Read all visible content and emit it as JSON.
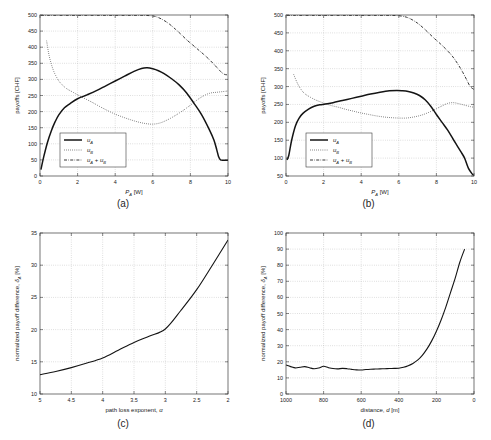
{
  "figure": {
    "background": "#ffffff",
    "ink": "#141414",
    "grid_color": "#9a9a9a",
    "panel_count": 4
  },
  "panels": [
    {
      "id": "a",
      "caption": "(a)",
      "legend_position": "lower-left-inside"
    },
    {
      "id": "b",
      "caption": "(b)",
      "legend_position": "lower-left-inside"
    },
    {
      "id": "c",
      "caption": "(c)",
      "legend_position": "none"
    },
    {
      "id": "d",
      "caption": "(d)",
      "legend_position": "none"
    }
  ],
  "chart_data": [
    {
      "type": "line",
      "panel": "a",
      "title": "",
      "xlabel": "P_A [W]",
      "xlabel_parts": {
        "main": "P",
        "sub": "A",
        "unit": " [W]"
      },
      "ylabel": "payoffs [CHF]",
      "xlim": [
        0,
        10
      ],
      "ylim": [
        0,
        500
      ],
      "xticks": [
        0,
        2,
        4,
        6,
        8,
        10
      ],
      "xticklabels": [
        "0",
        "2",
        "4",
        "6",
        "8",
        "10"
      ],
      "yticks": [
        0,
        50,
        100,
        150,
        200,
        250,
        300,
        350,
        400,
        450,
        500
      ],
      "yticklabels": [
        "0",
        "50",
        "100",
        "150",
        "200",
        "250",
        "300",
        "350",
        "400",
        "450",
        "500"
      ],
      "x_reversed": false,
      "grid": true,
      "legend": [
        "u_A",
        "u_B",
        "u_A + u_B"
      ],
      "legend_labels": [
        {
          "main": "u",
          "sub": "A",
          "tail": ""
        },
        {
          "main": "u",
          "sub": "B",
          "tail": ""
        },
        {
          "main": "u",
          "sub": "A",
          "tail": " + u_B"
        }
      ],
      "series": [
        {
          "name": "u_A",
          "style": "solid",
          "x": [
            0.05,
            0.2,
            0.4,
            0.6,
            0.8,
            1.0,
            1.3,
            1.6,
            2.0,
            2.5,
            3.0,
            3.5,
            4.0,
            4.5,
            5.0,
            5.4,
            5.7,
            6.0,
            6.3,
            6.6,
            7.0,
            7.4,
            7.8,
            8.2,
            8.6,
            9.0,
            9.25,
            9.4,
            9.5,
            9.6,
            9.8,
            10.0
          ],
          "y": [
            20,
            60,
            105,
            140,
            168,
            190,
            212,
            225,
            240,
            252,
            265,
            280,
            295,
            310,
            325,
            334,
            336,
            333,
            327,
            318,
            302,
            283,
            258,
            225,
            190,
            145,
            112,
            82,
            60,
            50,
            49,
            49
          ]
        },
        {
          "name": "u_B",
          "style": "dotted",
          "x": [
            0.35,
            0.5,
            0.7,
            0.9,
            1.1,
            1.4,
            1.7,
            2.0,
            2.4,
            2.8,
            3.2,
            3.6,
            4.0,
            4.4,
            4.8,
            5.2,
            5.6,
            6.0,
            6.4,
            6.8,
            7.2,
            7.6,
            8.0,
            8.4,
            8.8,
            9.1,
            9.4,
            9.7,
            10.0
          ],
          "y": [
            420,
            370,
            330,
            305,
            288,
            272,
            262,
            252,
            240,
            228,
            215,
            203,
            192,
            183,
            175,
            168,
            163,
            161,
            165,
            175,
            188,
            203,
            220,
            238,
            252,
            258,
            260,
            262,
            264
          ]
        },
        {
          "name": "u_A + u_B",
          "style": "dashdot",
          "x": [
            0.05,
            0.5,
            1.0,
            1.5,
            2.0,
            2.5,
            3.0,
            3.5,
            4.0,
            4.5,
            5.0,
            5.5,
            6.0,
            6.3,
            6.6,
            6.9,
            7.2,
            7.5,
            7.8,
            8.1,
            8.4,
            8.7,
            9.0,
            9.3,
            9.6,
            9.8,
            10.0
          ],
          "y": [
            499,
            499,
            499,
            499,
            499,
            499,
            499,
            499,
            499,
            499,
            499,
            499,
            497,
            492,
            483,
            471,
            456,
            440,
            423,
            408,
            393,
            378,
            362,
            344,
            325,
            316,
            314
          ]
        }
      ]
    },
    {
      "type": "line",
      "panel": "b",
      "title": "",
      "xlabel": "P_A [W]",
      "xlabel_parts": {
        "main": "P",
        "sub": "A",
        "unit": " [W]"
      },
      "ylabel": "payoffs [CHF]",
      "xlim": [
        0,
        10
      ],
      "ylim": [
        50,
        500
      ],
      "xticks": [
        0,
        2,
        4,
        6,
        8,
        10
      ],
      "xticklabels": [
        "0",
        "2",
        "4",
        "6",
        "8",
        "10"
      ],
      "yticks": [
        50,
        100,
        150,
        200,
        250,
        300,
        350,
        400,
        450,
        500
      ],
      "yticklabels": [
        "50",
        "100",
        "150",
        "200",
        "250",
        "300",
        "350",
        "400",
        "450",
        "500"
      ],
      "x_reversed": false,
      "grid": true,
      "legend": [
        "u_A",
        "u_B",
        "u_A + u_B"
      ],
      "legend_labels": [
        {
          "main": "u",
          "sub": "A",
          "tail": ""
        },
        {
          "main": "u",
          "sub": "B",
          "tail": ""
        },
        {
          "main": "u",
          "sub": "A",
          "tail": " + u_B"
        }
      ],
      "series": [
        {
          "name": "u_A",
          "style": "solid",
          "x": [
            0.05,
            0.15,
            0.3,
            0.5,
            0.7,
            0.9,
            1.2,
            1.5,
            1.8,
            2.1,
            2.5,
            3.0,
            3.5,
            4.0,
            4.5,
            5.0,
            5.5,
            5.9,
            6.2,
            6.5,
            6.8,
            7.1,
            7.4,
            7.7,
            8.0,
            8.3,
            8.6,
            8.9,
            9.1,
            9.3,
            9.5,
            9.7,
            9.9,
            10.0
          ],
          "y": [
            95,
            108,
            150,
            190,
            212,
            225,
            237,
            245,
            249,
            251,
            255,
            261,
            267,
            273,
            279,
            284,
            288,
            289,
            288,
            286,
            282,
            275,
            263,
            245,
            222,
            200,
            178,
            152,
            135,
            118,
            100,
            72,
            56,
            52
          ]
        },
        {
          "name": "u_B",
          "style": "dotted",
          "x": [
            0.4,
            0.6,
            0.8,
            1.0,
            1.3,
            1.6,
            2.0,
            2.4,
            2.8,
            3.2,
            3.6,
            4.0,
            4.4,
            4.8,
            5.2,
            5.6,
            6.0,
            6.4,
            6.8,
            7.2,
            7.6,
            8.0,
            8.3,
            8.6,
            8.9,
            9.2,
            9.5,
            9.8,
            10.0
          ],
          "y": [
            335,
            310,
            292,
            280,
            270,
            262,
            254,
            247,
            242,
            236,
            231,
            226,
            222,
            218,
            215,
            213,
            212,
            212,
            215,
            220,
            228,
            238,
            246,
            253,
            255,
            252,
            248,
            244,
            242
          ]
        },
        {
          "name": "u_A + u_B",
          "style": "dashdot",
          "x": [
            0.05,
            0.5,
            1.0,
            1.5,
            2.0,
            2.5,
            3.0,
            3.5,
            4.0,
            4.5,
            5.0,
            5.5,
            6.0,
            6.4,
            6.7,
            7.0,
            7.3,
            7.6,
            7.9,
            8.2,
            8.5,
            8.8,
            9.0,
            9.2,
            9.4,
            9.6,
            9.8,
            10.0
          ],
          "y": [
            499,
            499,
            499,
            499,
            499,
            499,
            499,
            499,
            499,
            499,
            499,
            499,
            498,
            494,
            487,
            477,
            464,
            449,
            434,
            420,
            405,
            388,
            374,
            358,
            340,
            320,
            300,
            292
          ]
        }
      ]
    },
    {
      "type": "line",
      "panel": "c",
      "title": "",
      "xlabel": "path loss exponent, α",
      "xlabel_parts": {
        "main": "path loss exponent, ",
        "sym": "α"
      },
      "ylabel": "normalized payoff difference, δ_A [%]",
      "ylabel_parts": {
        "main": "normalized payoff difference, ",
        "sym": "δ",
        "sub": "A",
        "unit": " [%]"
      },
      "xlim": [
        5,
        2
      ],
      "ylim": [
        10,
        35
      ],
      "xticks": [
        5,
        4.5,
        4,
        3.5,
        3,
        2.5,
        2
      ],
      "xticklabels": [
        "5",
        "4.5",
        "4",
        "3.5",
        "3",
        "2.5",
        "2"
      ],
      "yticks": [
        10,
        15,
        20,
        25,
        30,
        35
      ],
      "yticklabels": [
        "10",
        "15",
        "20",
        "25",
        "30",
        "35"
      ],
      "x_reversed": true,
      "grid": true,
      "legend": [],
      "series": [
        {
          "name": "δ_A",
          "style": "thin",
          "x": [
            5.0,
            4.75,
            4.5,
            4.25,
            4.0,
            3.75,
            3.5,
            3.25,
            3.0,
            2.75,
            2.5,
            2.25,
            2.0
          ],
          "y": [
            13.0,
            13.5,
            14.1,
            14.8,
            15.6,
            16.8,
            18.0,
            19.0,
            20.1,
            23.0,
            26.2,
            30.0,
            33.9
          ]
        }
      ]
    },
    {
      "type": "line",
      "panel": "d",
      "title": "",
      "xlabel": "distance, d [m]",
      "xlabel_parts": {
        "main": "distance, ",
        "sym": "d",
        "unit": " [m]"
      },
      "ylabel": "normalized payoff difference, δ_A [%]",
      "ylabel_parts": {
        "main": "normalized payoff difference, ",
        "sym": "δ",
        "sub": "A",
        "unit": " [%]"
      },
      "xlim": [
        1000,
        0
      ],
      "ylim": [
        0,
        100
      ],
      "xticks": [
        1000,
        800,
        600,
        400,
        200,
        0
      ],
      "xticklabels": [
        "1000",
        "800",
        "600",
        "400",
        "200",
        "0"
      ],
      "yticks": [
        0,
        10,
        20,
        30,
        40,
        50,
        60,
        70,
        80,
        90,
        100
      ],
      "yticklabels": [
        "0",
        "10",
        "20",
        "30",
        "40",
        "50",
        "60",
        "70",
        "80",
        "90",
        "100"
      ],
      "x_reversed": true,
      "grid": true,
      "legend": [],
      "series": [
        {
          "name": "δ_A",
          "style": "thin",
          "x": [
            1000,
            975,
            950,
            925,
            900,
            875,
            850,
            825,
            800,
            775,
            750,
            725,
            700,
            675,
            650,
            625,
            600,
            575,
            550,
            525,
            500,
            475,
            450,
            425,
            400,
            375,
            350,
            325,
            300,
            275,
            250,
            225,
            200,
            175,
            150,
            125,
            100,
            75,
            50
          ],
          "y": [
            18.0,
            17.0,
            16.2,
            16.6,
            17.0,
            16.3,
            15.7,
            16.2,
            17.2,
            16.4,
            15.8,
            15.6,
            15.9,
            15.7,
            15.3,
            15.0,
            14.9,
            15.2,
            15.4,
            15.5,
            15.6,
            15.7,
            15.8,
            15.9,
            16.0,
            16.6,
            17.6,
            19.0,
            21.0,
            24.0,
            28.0,
            33.0,
            39.0,
            46.0,
            54.0,
            63.0,
            72.0,
            82.0,
            90.0
          ]
        }
      ]
    }
  ]
}
